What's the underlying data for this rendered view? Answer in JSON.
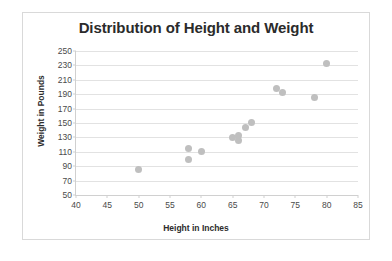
{
  "chart_data": {
    "type": "scatter",
    "title": "Distribution of Height and Weight",
    "xlabel": "Height in Inches",
    "ylabel": "Weight in Pounds",
    "xlim": [
      40,
      85
    ],
    "ylim": [
      50,
      250
    ],
    "xticks": [
      40,
      45,
      50,
      55,
      60,
      65,
      70,
      75,
      80,
      85
    ],
    "yticks": [
      50,
      70,
      90,
      110,
      130,
      150,
      170,
      190,
      210,
      230,
      250
    ],
    "grid": "horizontal",
    "legend": null,
    "series": [
      {
        "name": "Height vs Weight",
        "color": "#bfbfbf",
        "marker": "circle",
        "points": [
          {
            "x": 50,
            "y": 85
          },
          {
            "x": 58,
            "y": 114
          },
          {
            "x": 58,
            "y": 99
          },
          {
            "x": 60,
            "y": 110
          },
          {
            "x": 65,
            "y": 130
          },
          {
            "x": 66,
            "y": 132
          },
          {
            "x": 66,
            "y": 126
          },
          {
            "x": 67,
            "y": 144
          },
          {
            "x": 68,
            "y": 151
          },
          {
            "x": 72,
            "y": 198
          },
          {
            "x": 73,
            "y": 192
          },
          {
            "x": 78,
            "y": 185
          },
          {
            "x": 80,
            "y": 233
          }
        ]
      }
    ]
  },
  "caption": {
    "bottom_text": ""
  }
}
